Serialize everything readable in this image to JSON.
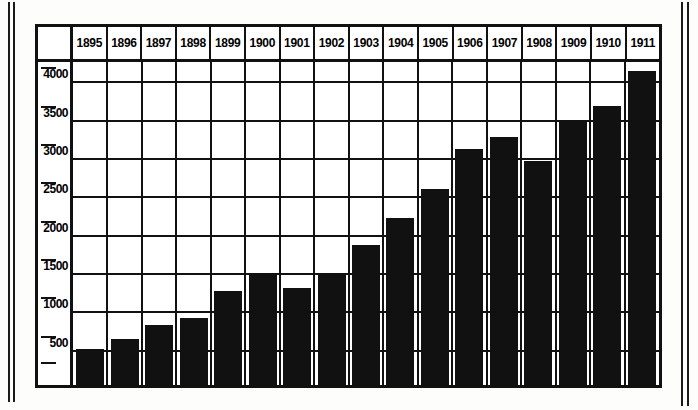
{
  "chart_data": {
    "type": "bar",
    "title": "",
    "xlabel": "",
    "ylabel": "",
    "categories": [
      "1895",
      "1896",
      "1897",
      "1898",
      "1899",
      "1900",
      "1901",
      "1902",
      "1903",
      "1904",
      "1905",
      "1906",
      "1907",
      "1908",
      "1909",
      "1910",
      "1911"
    ],
    "values": [
      470,
      600,
      780,
      880,
      1220,
      1430,
      1270,
      1440,
      1820,
      2180,
      2560,
      3080,
      3230,
      2920,
      3430,
      3640,
      4100
    ],
    "ylim": [
      0,
      4250
    ],
    "ytick_labels": [
      "4000",
      "3500",
      "3000",
      "2500",
      "2000",
      "1500",
      "1000",
      "500"
    ],
    "ytick_values": [
      4000,
      3500,
      3000,
      2500,
      2000,
      1500,
      1000,
      500
    ],
    "grid": true,
    "legend": null,
    "bar_color": "#111111",
    "frame_color": "#111111",
    "background_color": "#ffffff"
  },
  "axis": {
    "labels": [
      {
        "text": "4000",
        "value": 4000
      },
      {
        "text": "3500",
        "value": 3500
      },
      {
        "text": "3000",
        "value": 3000
      },
      {
        "text": "2500",
        "value": 2500
      },
      {
        "text": "2000",
        "value": 2000
      },
      {
        "text": "1500",
        "value": 1500
      },
      {
        "text": "1000",
        "value": 1000
      },
      {
        "text": "500",
        "value": 500
      }
    ]
  }
}
